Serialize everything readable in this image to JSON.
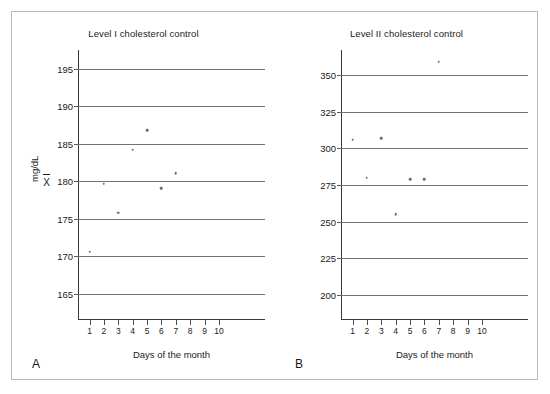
{
  "figure": {
    "border_color": "#b8b8b8",
    "background": "#ffffff",
    "point_color": "#6e6e6e",
    "gridline_color": "#737373",
    "axis_color": "#3a3a3a"
  },
  "panels": [
    {
      "letter": "A",
      "title": "Level I cholesterol control",
      "xlabel": "Days of the month",
      "ylabel": "mg/dL",
      "mean_symbol": "X",
      "mean_value": 180
    },
    {
      "letter": "B",
      "title": "Level II cholesterol control",
      "xlabel": "Days of the month",
      "ylabel": "",
      "mean_symbol": "",
      "mean_value": null
    }
  ],
  "chart_data": [
    {
      "type": "scatter",
      "title": "Level I cholesterol control",
      "xlabel": "Days of the month",
      "ylabel": "mg/dL",
      "x": [
        1,
        2,
        3,
        4,
        5,
        6,
        7
      ],
      "values": [
        170.6,
        179.7,
        175.8,
        184.2,
        186.8,
        179.1,
        181.1
      ],
      "xticks": [
        1,
        2,
        3,
        4,
        5,
        6,
        7,
        8,
        9,
        10
      ],
      "yticks": [
        165,
        170,
        175,
        180,
        185,
        190,
        195
      ],
      "ytick_labels": [
        "165",
        "170",
        "175",
        "180",
        "185",
        "190",
        "195"
      ],
      "xlim": [
        0.2,
        13.2
      ],
      "ylim": [
        161.5,
        197.5
      ],
      "grid": true,
      "legend": "none",
      "mean_line_label": "X̄ 180",
      "mean": 180
    },
    {
      "type": "scatter",
      "title": "Level II cholesterol control",
      "xlabel": "Days of the month",
      "ylabel": "",
      "x": [
        1,
        2,
        3,
        4,
        5,
        6,
        7
      ],
      "values": [
        306,
        280,
        307,
        255,
        279,
        279,
        359
      ],
      "xticks": [
        1,
        2,
        3,
        4,
        5,
        6,
        7,
        8,
        9,
        10
      ],
      "yticks": [
        200,
        225,
        250,
        275,
        300,
        325,
        350
      ],
      "ytick_labels": [
        "200",
        "225",
        "250",
        "275",
        "300",
        "325",
        "350"
      ],
      "xlim": [
        0.2,
        13.2
      ],
      "ylim": [
        183,
        367
      ],
      "grid": true,
      "legend": "none"
    }
  ]
}
